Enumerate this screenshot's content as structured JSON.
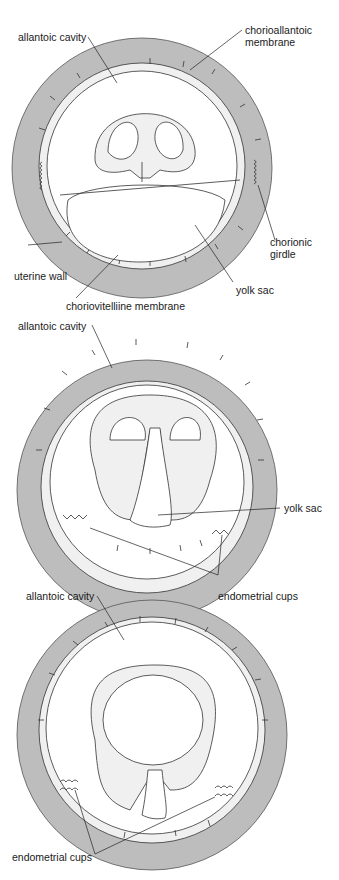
{
  "figure": {
    "panels": [
      {
        "id": "early",
        "labels": {
          "allantoic_cavity": "allantoic cavity",
          "chorioallantoic_membrane_1": "chorioallantoic",
          "chorioallantoic_membrane_2": "membrane",
          "chorionic_girdle_1": "chorionic",
          "chorionic_girdle_2": "girdle",
          "uterine_wall": "uterine wall",
          "yolk_sac": "yolk sac",
          "choriovitelline_membrane": "choriovitelliine membrane"
        }
      },
      {
        "id": "middle",
        "labels": {
          "allantoic_cavity": "allantoic cavity",
          "yolk_sac": "yolk sac",
          "endometrial_cups": "endometrial cups"
        }
      },
      {
        "id": "late",
        "labels": {
          "allantoic_cavity": "allantoic cavity",
          "endometrial_cups": "endometrial cups"
        }
      }
    ],
    "colors": {
      "uterine_wall": "#bdbdbd",
      "membrane_fill": "#f0f0f0",
      "line": "#333333"
    }
  }
}
